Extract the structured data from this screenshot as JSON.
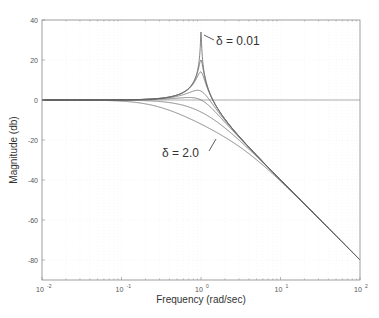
{
  "chart_data": {
    "type": "line",
    "title": "",
    "xlabel": "Frequency (rad/sec)",
    "ylabel": "Magnitude (db)",
    "xscale": "log",
    "xlim": [
      0.01,
      100
    ],
    "ylim": [
      -90,
      40
    ],
    "grid": true,
    "x_ticks": [
      {
        "value": 0.01,
        "label": "10",
        "exp": "-2"
      },
      {
        "value": 0.1,
        "label": "10",
        "exp": "-1"
      },
      {
        "value": 1,
        "label": "10",
        "exp": "0"
      },
      {
        "value": 10,
        "label": "10",
        "exp": "1"
      },
      {
        "value": 100,
        "label": "10",
        "exp": "2"
      }
    ],
    "y_ticks": [
      40,
      20,
      0,
      -20,
      -40,
      -60,
      -80
    ],
    "model": "20*log10(1/|1 - (w/wn)^2 + j*2*delta*(w/wn)|), wn = 1",
    "series": [
      {
        "name": "δ = 0.01",
        "delta": 0.01,
        "peak_db": 34
      },
      {
        "name": "δ = 0.05",
        "delta": 0.05,
        "peak_db": 20
      },
      {
        "name": "δ = 0.1",
        "delta": 0.1,
        "peak_db": 14
      },
      {
        "name": "δ = 0.3",
        "delta": 0.3
      },
      {
        "name": "δ = 0.5",
        "delta": 0.5
      },
      {
        "name": "δ = 1.0",
        "delta": 1.0
      },
      {
        "name": "δ = 2.0",
        "delta": 2.0
      }
    ],
    "annotations": [
      {
        "text": "δ = 0.01",
        "points_to_delta": 0.01
      },
      {
        "text": "δ = 2.0",
        "points_to_delta": 2.0
      }
    ],
    "zero_line": true
  },
  "labels": {
    "xlabel": "Frequency (rad/sec)",
    "ylabel": "Magnitude (db)",
    "annot_top": "δ = 0.01",
    "annot_bottom": "δ = 2.0"
  }
}
